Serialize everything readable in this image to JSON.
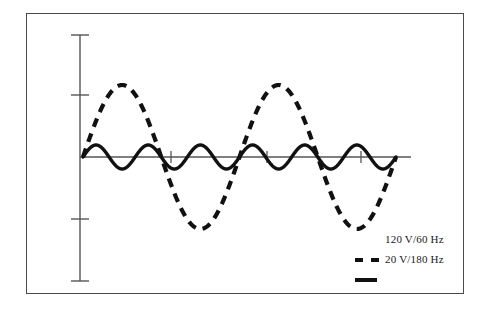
{
  "chart_data": {
    "type": "line",
    "title": "",
    "subtitle": "",
    "xlabel": "",
    "ylabel": "",
    "xlim": [
      0,
      2
    ],
    "ylim": [
      -160,
      160
    ],
    "grid": false,
    "legend_position": "bottom-right",
    "annotations": [],
    "axis": {
      "y_axis_ticks": [
        "",
        "",
        "",
        "",
        ""
      ],
      "x_axis_ticks": [
        "",
        "",
        ""
      ],
      "y_tick_count": 5,
      "x_tick_count": 3,
      "zero_line": 0
    },
    "series": [
      {
        "name": "120 V/60 Hz",
        "style": "dashed",
        "color": "#111111",
        "amplitude_volts": 120,
        "frequency_hz": 60,
        "cycles_shown": 2,
        "phase_deg": 0,
        "waveform": "sine"
      },
      {
        "name": "20 V/180 Hz",
        "style": "solid",
        "color": "#111111",
        "amplitude_volts": 20,
        "frequency_hz": 180,
        "cycles_shown": 6,
        "phase_deg": 0,
        "waveform": "sine"
      }
    ]
  },
  "legend": {
    "entries": [
      {
        "label": "120 V/60 Hz",
        "swatch": "none"
      },
      {
        "label": "20 V/180 Hz",
        "swatch": "dashed"
      },
      {
        "label": "",
        "swatch": "solid"
      }
    ]
  },
  "colors": {
    "frame": "#4a4a52",
    "axis": "#555555",
    "trace": "#111111",
    "background": "#ffffff"
  }
}
